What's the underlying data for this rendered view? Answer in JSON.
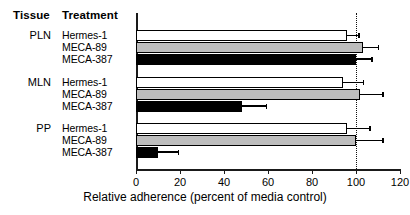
{
  "table_headers": {
    "tissue": "Tissue",
    "treatment": "Treatment"
  },
  "axis": {
    "x_title": "Relative adherence (percent of media control)",
    "ticks": [
      {
        "value": 0,
        "label": "0"
      },
      {
        "value": 20,
        "label": "20"
      },
      {
        "value": 40,
        "label": "40"
      },
      {
        "value": 60,
        "label": "60"
      },
      {
        "value": 80,
        "label": "80"
      },
      {
        "value": 100,
        "label": "100"
      },
      {
        "value": 120,
        "label": "120"
      }
    ],
    "reference_line_value": 100
  },
  "groups": [
    {
      "tissue": "PLN",
      "treatments": [
        "Hermes-1",
        "MECA-89",
        "MECA-387"
      ]
    },
    {
      "tissue": "MLN",
      "treatments": [
        "Hermes-1",
        "MECA-89",
        "MECA-387"
      ]
    },
    {
      "tissue": "PP",
      "treatments": [
        "Hermes-1",
        "MECA-89",
        "MECA-387"
      ]
    }
  ],
  "chart_data": {
    "type": "bar",
    "orientation": "horizontal",
    "title": "",
    "xlabel": "Relative adherence (percent of media control)",
    "ylabel": "",
    "xlim": [
      0,
      120
    ],
    "xticks": [
      0,
      20,
      40,
      60,
      80,
      100,
      120
    ],
    "grid": false,
    "legend": "none",
    "reference_line": {
      "value": 100,
      "style": "dotted"
    },
    "annotations": [
      "Tissue column lists PLN, MLN, PP",
      "Treatment column lists Hermes-1, MECA-89, MECA-387 per tissue",
      "Vertical dotted line marks 100 percent of media control"
    ],
    "categories": [
      "PLN Hermes-1",
      "PLN MECA-89",
      "PLN MECA-387",
      "MLN Hermes-1",
      "MLN MECA-89",
      "MLN MECA-387",
      "PP Hermes-1",
      "PP MECA-89",
      "PP MECA-387"
    ],
    "values": [
      96,
      103,
      100,
      94,
      102,
      48,
      96,
      100,
      10
    ],
    "errors_upper": [
      5,
      7,
      7,
      9,
      10,
      11,
      10,
      12,
      9
    ],
    "fills": [
      "white",
      "gray",
      "black",
      "white",
      "gray",
      "black",
      "white",
      "gray",
      "black"
    ],
    "bars": [
      {
        "tissue": "PLN",
        "treatment": "Hermes-1",
        "value": 96,
        "error_upper": 5,
        "fill": "white"
      },
      {
        "tissue": "PLN",
        "treatment": "MECA-89",
        "value": 103,
        "error_upper": 7,
        "fill": "gray"
      },
      {
        "tissue": "PLN",
        "treatment": "MECA-387",
        "value": 100,
        "error_upper": 7,
        "fill": "black"
      },
      {
        "tissue": "MLN",
        "treatment": "Hermes-1",
        "value": 94,
        "error_upper": 9,
        "fill": "white"
      },
      {
        "tissue": "MLN",
        "treatment": "MECA-89",
        "value": 102,
        "error_upper": 10,
        "fill": "gray"
      },
      {
        "tissue": "MLN",
        "treatment": "MECA-387",
        "value": 48,
        "error_upper": 11,
        "fill": "black"
      },
      {
        "tissue": "PP",
        "treatment": "Hermes-1",
        "value": 96,
        "error_upper": 10,
        "fill": "white"
      },
      {
        "tissue": "PP",
        "treatment": "MECA-89",
        "value": 100,
        "error_upper": 12,
        "fill": "gray"
      },
      {
        "tissue": "PP",
        "treatment": "MECA-387",
        "value": 10,
        "error_upper": 9,
        "fill": "black"
      }
    ]
  }
}
